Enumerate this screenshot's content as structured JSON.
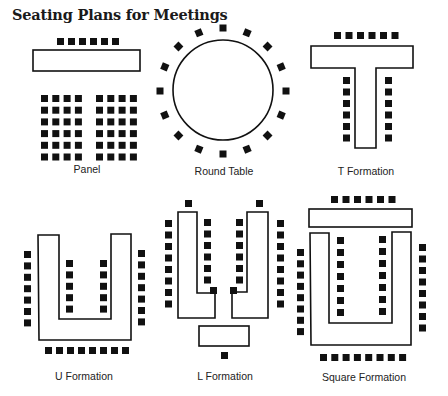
{
  "title": "Seating Plans for Meetings",
  "colors": {
    "ink": "#111111",
    "background": "#ffffff"
  },
  "plans": [
    {
      "id": "panel",
      "label": "Panel",
      "label_pos": [
        87,
        163
      ],
      "tables": [
        {
          "type": "rect",
          "x": 33,
          "y": 50,
          "w": 107,
          "h": 21
        }
      ],
      "chair_rows": [
        {
          "x0": 57,
          "y0": 38,
          "dx": 11,
          "dy": 0,
          "n": 6
        }
      ],
      "chair_grids": [
        {
          "x0": 41,
          "y0": 95,
          "dx": 11.3,
          "dy": 11.7,
          "cols": 4,
          "rows": 6
        },
        {
          "x0": 96,
          "y0": 95,
          "dx": 11.3,
          "dy": 11.7,
          "cols": 4,
          "rows": 6
        }
      ],
      "chair_count": 54
    },
    {
      "id": "round-table",
      "label": "Round Table",
      "label_pos": [
        224,
        165
      ],
      "tables": [
        {
          "type": "circle",
          "cx": 223,
          "cy": 90,
          "r": 50
        }
      ],
      "chair_ring": {
        "cx": 223,
        "cy": 91,
        "r": 63,
        "n": 16,
        "start_deg": -90
      },
      "chair_count": 16
    },
    {
      "id": "t-formation",
      "label": "T Formation",
      "label_pos": [
        366,
        165
      ],
      "tables": [
        {
          "type": "poly",
          "points": "311,46 413,46 413,68 376,68 376,148 355,148 355,68 311,68"
        }
      ],
      "chair_rows": [
        {
          "x0": 334,
          "y0": 32,
          "dx": 11.5,
          "dy": 0,
          "n": 6
        },
        {
          "x0": 343,
          "y0": 77,
          "dx": 0,
          "dy": 11.5,
          "n": 6
        },
        {
          "x0": 385,
          "y0": 77,
          "dx": 0,
          "dy": 11.5,
          "n": 6
        }
      ],
      "chair_count": 18
    },
    {
      "id": "u-formation",
      "label": "U Formation",
      "label_pos": [
        84,
        370
      ],
      "tables": [
        {
          "type": "poly",
          "points": "38,235 59,235 59,319 111,319 111,234 131,234 131,340 39,340"
        }
      ],
      "chair_rows": [
        {
          "x0": 24,
          "y0": 251,
          "dx": 0,
          "dy": 11.4,
          "n": 7
        },
        {
          "x0": 138,
          "y0": 250,
          "dx": 0,
          "dy": 11.4,
          "n": 7
        },
        {
          "x0": 66,
          "y0": 260,
          "dx": 0,
          "dy": 11.4,
          "n": 5
        },
        {
          "x0": 100,
          "y0": 260,
          "dx": 0,
          "dy": 11.4,
          "n": 5
        },
        {
          "x0": 45,
          "y0": 347,
          "dx": 11,
          "dy": 0,
          "n": 8
        }
      ],
      "chair_count": 32
    },
    {
      "id": "l-formation",
      "label": "L Formation",
      "label_pos": [
        225,
        370
      ],
      "tables": [
        {
          "type": "poly",
          "points": "178,212 197,212 197,293 215,293 215,318 178,318"
        },
        {
          "type": "poly",
          "points": "247,212 268,212 268,318 232,318 232,292 247,292"
        },
        {
          "type": "rect",
          "x": 199,
          "y": 326,
          "w": 50,
          "h": 20
        }
      ],
      "chair_rows": [
        {
          "x0": 185,
          "y0": 200,
          "dx": 0,
          "dy": 0,
          "n": 1
        },
        {
          "x0": 256,
          "y0": 200,
          "dx": 0,
          "dy": 0,
          "n": 1
        },
        {
          "x0": 165,
          "y0": 220,
          "dx": 0,
          "dy": 11.5,
          "n": 8
        },
        {
          "x0": 277,
          "y0": 220,
          "dx": 0,
          "dy": 11.5,
          "n": 8
        },
        {
          "x0": 204,
          "y0": 219,
          "dx": 0,
          "dy": 11.5,
          "n": 6
        },
        {
          "x0": 236,
          "y0": 219,
          "dx": 0,
          "dy": 11.5,
          "n": 6
        },
        {
          "x0": 210,
          "y0": 287,
          "dx": 0,
          "dy": 0,
          "n": 1
        },
        {
          "x0": 230,
          "y0": 287,
          "dx": 0,
          "dy": 0,
          "n": 1
        },
        {
          "x0": 221,
          "y0": 352,
          "dx": 0,
          "dy": 0,
          "n": 1
        }
      ],
      "chair_count": 33
    },
    {
      "id": "square-formation",
      "label": "Square Formation",
      "label_pos": [
        364,
        371
      ],
      "tables": [
        {
          "type": "rect",
          "x": 309,
          "y": 209,
          "w": 103,
          "h": 18
        },
        {
          "type": "poly",
          "points": "310,233 329,233 329,323 392,323 392,232 411,232 411,345 311,345"
        }
      ],
      "chair_rows": [
        {
          "x0": 331,
          "y0": 196,
          "dx": 11.5,
          "dy": 0,
          "n": 6
        },
        {
          "x0": 297,
          "y0": 249,
          "dx": 0,
          "dy": 11.3,
          "n": 8
        },
        {
          "x0": 419,
          "y0": 244,
          "dx": 0,
          "dy": 11.5,
          "n": 8
        },
        {
          "x0": 337,
          "y0": 237,
          "dx": 0,
          "dy": 12,
          "n": 7
        },
        {
          "x0": 379,
          "y0": 236,
          "dx": 0,
          "dy": 12,
          "n": 7
        },
        {
          "x0": 320,
          "y0": 354,
          "dx": 11.3,
          "dy": 0,
          "n": 8
        }
      ],
      "chair_count": 44
    }
  ]
}
